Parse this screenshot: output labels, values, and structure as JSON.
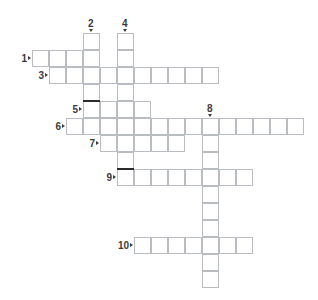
{
  "puzzle": {
    "type": "crossword-grid",
    "title": "Crossword puzzle grid",
    "cell_size": 17,
    "origin": {
      "x": 32,
      "y": 50
    },
    "colors": {
      "cell_border": "#b9bcc0",
      "cell_fill": "#ffffff",
      "block_bar": "#2b2b2b",
      "number": "#3a3a3a",
      "background": "#ffffff"
    },
    "entries": [
      {
        "number": "1",
        "direction": "across",
        "row": 0,
        "col": 0,
        "length": 4,
        "label_side": "left"
      },
      {
        "number": "2",
        "direction": "down",
        "row": -1,
        "col": 3,
        "length": 5,
        "label_side": "top"
      },
      {
        "number": "3",
        "direction": "across",
        "row": 1,
        "col": 1,
        "length": 10,
        "label_side": "left"
      },
      {
        "number": "4",
        "direction": "down",
        "row": -1,
        "col": 5,
        "length": 8,
        "label_side": "top"
      },
      {
        "number": "5",
        "direction": "across",
        "row": 3,
        "col": 3,
        "length": 4,
        "label_side": "left"
      },
      {
        "number": "6",
        "direction": "across",
        "row": 4,
        "col": 2,
        "length": 14,
        "label_side": "left"
      },
      {
        "number": "7",
        "direction": "across",
        "row": 5,
        "col": 4,
        "length": 5,
        "label_side": "left"
      },
      {
        "number": "8",
        "direction": "down",
        "row": 4,
        "col": 10,
        "length": 10,
        "label_side": "top"
      },
      {
        "number": "9",
        "direction": "across",
        "row": 7,
        "col": 5,
        "length": 8,
        "label_side": "left"
      },
      {
        "number": "10",
        "direction": "across",
        "row": 11,
        "col": 6,
        "length": 7,
        "label_side": "left"
      }
    ],
    "block_bars": [
      {
        "row": 3,
        "col": 3,
        "edge": "top"
      },
      {
        "row": 7,
        "col": 5,
        "edge": "top"
      }
    ],
    "numbers": [
      {
        "text": "1",
        "arrow": "right"
      },
      {
        "text": "2",
        "arrow": "down"
      },
      {
        "text": "3",
        "arrow": "right"
      },
      {
        "text": "4",
        "arrow": "down"
      },
      {
        "text": "5",
        "arrow": "right"
      },
      {
        "text": "6",
        "arrow": "right"
      },
      {
        "text": "7",
        "arrow": "right"
      },
      {
        "text": "8",
        "arrow": "down"
      },
      {
        "text": "9",
        "arrow": "right"
      },
      {
        "text": "10",
        "arrow": "right"
      }
    ]
  }
}
